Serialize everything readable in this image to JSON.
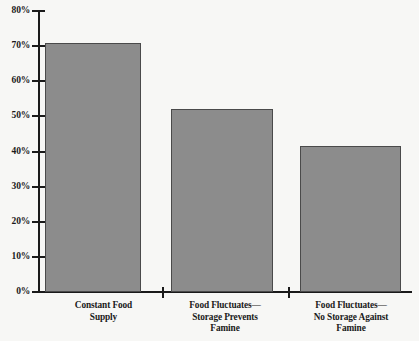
{
  "chart_data": {
    "type": "bar",
    "title": "",
    "subtitle": "",
    "xlabel": "",
    "ylabel": "",
    "categories": [
      "Constant Food Supply",
      "Food Fluctuates—Storage Prevents Famine",
      "Food Fluctuates—No Storage Against Famine"
    ],
    "category_lines": [
      [
        "Constant Food",
        "Supply"
      ],
      [
        "Food Fluctuates—",
        "Storage Prevents",
        "Famine"
      ],
      [
        "Food Fluctuates—",
        "No Storage Against",
        "Famine"
      ]
    ],
    "values": [
      71,
      52,
      41.5
    ],
    "value_labels": [
      "71%",
      "52%",
      "41.5%"
    ],
    "ylim": [
      0,
      80
    ],
    "ytick_values": [
      0,
      10,
      20,
      30,
      40,
      50,
      60,
      70,
      80
    ],
    "ytick_labels": [
      "0%",
      "10%",
      "20%",
      "30%",
      "40%",
      "50%",
      "60%",
      "70%",
      "80%"
    ],
    "grid": false,
    "legend": null,
    "legend_position": "none",
    "colors": {
      "bar_fill": "#8c8c8c",
      "bar_border": "#4a4a4a",
      "axis": "#1a1a1a",
      "background": "#f7f7f5",
      "text": "#1a1a1a"
    }
  }
}
